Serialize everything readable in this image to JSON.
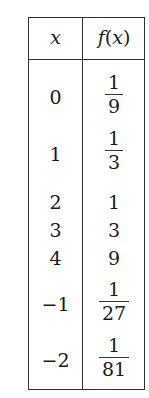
{
  "table": {
    "headers": {
      "x": "x",
      "fx_f": "f",
      "fx_open": "(",
      "fx_x": "x",
      "fx_close": ")"
    },
    "rows": [
      {
        "x": "0",
        "fx_type": "fraction",
        "num": "1",
        "den": "9"
      },
      {
        "x": "1",
        "fx_type": "fraction",
        "num": "1",
        "den": "3"
      },
      {
        "x": "2",
        "fx_type": "integer",
        "value": "1"
      },
      {
        "x": "3",
        "fx_type": "integer",
        "value": "3"
      },
      {
        "x": "4",
        "fx_type": "integer",
        "value": "9"
      },
      {
        "x": "−1",
        "fx_type": "fraction",
        "num": "1",
        "den": "27"
      },
      {
        "x": "−2",
        "fx_type": "fraction",
        "num": "1",
        "den": "81"
      }
    ]
  }
}
